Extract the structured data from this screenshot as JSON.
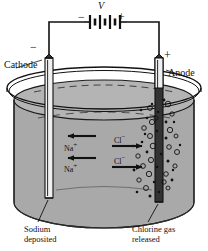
{
  "figure": {
    "type": "diagram"
  },
  "circuit": {
    "source_label": "V",
    "source_minus": "−",
    "source_plus": "+",
    "battery_icon": "battery-cells-icon",
    "wire_icon": "wire-icon"
  },
  "electrodes": {
    "cathode": {
      "name": "Cathode",
      "polarity": "−",
      "icon": "electrode-rod-icon"
    },
    "anode": {
      "name": "Anode",
      "polarity": "+",
      "icon": "electrode-rod-icon"
    }
  },
  "vessel": {
    "icon": "beaker-icon",
    "liquid_color": "#a9a9a9",
    "rim_color": "#1a1a1a"
  },
  "ions": [
    {
      "label": "Na",
      "charge": "+",
      "direction": "left",
      "name": "sodium-ion-upper"
    },
    {
      "label": "Na",
      "charge": "+",
      "direction": "left",
      "name": "sodium-ion-lower"
    },
    {
      "label": "Cl",
      "charge": "−",
      "direction": "right",
      "name": "chloride-ion-upper"
    },
    {
      "label": "Cl",
      "charge": "−",
      "direction": "right",
      "name": "chloride-ion-lower"
    }
  ],
  "ion_text": {
    "na_symbol": "Na",
    "na_charge": "+",
    "cl_symbol": "Cl",
    "cl_charge": "−"
  },
  "callouts": {
    "left_line1": "Sodium",
    "left_line2": "deposited",
    "right_line1": "Chlorine gas",
    "right_line2": "released"
  },
  "bubbles": {
    "icon": "gas-bubble-icon",
    "count": 46
  },
  "colors": {
    "ink": "#111111",
    "liquid": "#a9a9a9",
    "liquid_dark": "#9a9a9a",
    "background": "#ffffff"
  }
}
